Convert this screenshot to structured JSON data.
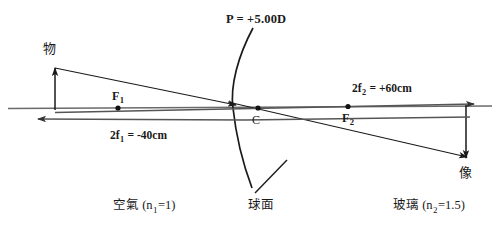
{
  "diagram": {
    "title_label": "P = +5.00D",
    "object_label": "物",
    "image_label": "像",
    "center_label": "C",
    "focal_point_1": "F",
    "focal_point_1_sub": "1",
    "focal_point_2": "F",
    "focal_point_2_sub": "2",
    "two_f1": {
      "prefix": "2f",
      "sub": "1",
      "suffix": " = -40cm"
    },
    "two_f2": {
      "prefix": "2f",
      "sub": "2",
      "suffix": " = +60cm"
    },
    "medium_left": {
      "name": "空氣",
      "index_open": " (n",
      "index_sub": "1",
      "index_close": "=1)"
    },
    "medium_right": {
      "name": "玻璃",
      "index_open": " (n",
      "index_sub": "2",
      "index_close": "=1.5)"
    },
    "surface_label": "球面",
    "colors": {
      "ink": "#1a1a1a",
      "axis": "#555555",
      "ray": "#222222",
      "background": "#ffffff"
    },
    "geometry": {
      "axis_y": 108,
      "vertex_x": 233,
      "object_base_x": 55,
      "object_tip_y": 68,
      "image_base_x": 466,
      "image_tip_y": 158,
      "f1_x": 118,
      "f2_x": 348,
      "c_x": 258
    }
  }
}
